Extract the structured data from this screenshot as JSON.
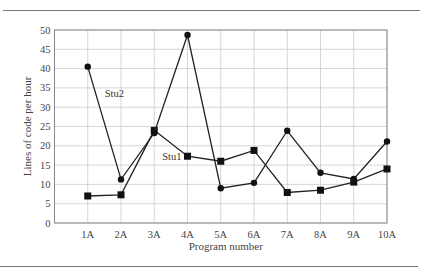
{
  "chart_data": {
    "type": "line",
    "title": "",
    "xlabel": "Program number",
    "ylabel": "Lines of code per hour",
    "categories": [
      "1A",
      "2A",
      "3A",
      "4A",
      "5A",
      "6A",
      "7A",
      "8A",
      "9A",
      "10A"
    ],
    "series": [
      {
        "name": "Stu1",
        "marker": "square",
        "values": [
          7.0,
          7.3,
          24.0,
          17.3,
          16.0,
          18.8,
          7.9,
          8.5,
          10.6,
          14.0
        ],
        "label_position": {
          "category_index": 3,
          "offset": "left"
        }
      },
      {
        "name": "Stu2",
        "marker": "circle",
        "values": [
          40.5,
          11.3,
          23.3,
          48.7,
          9.0,
          10.4,
          23.9,
          13.0,
          11.4,
          21.1
        ],
        "label_position": {
          "category_index": 0,
          "offset": "right"
        }
      }
    ],
    "yticks": [
      0,
      5,
      10,
      15,
      20,
      25,
      30,
      35,
      40,
      45,
      50
    ],
    "ylim": [
      0,
      50
    ],
    "grid": true,
    "legend": "inline labels",
    "line_color": "#222222",
    "grid_color": "#cccccc"
  }
}
